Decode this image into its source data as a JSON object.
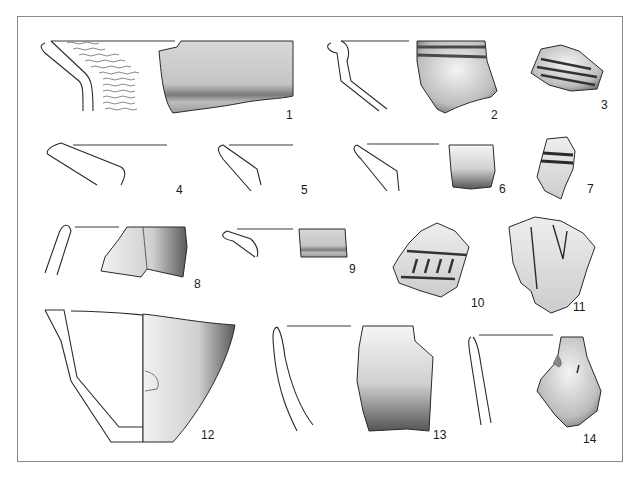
{
  "figure": {
    "type": "archaeological pottery sherd plate",
    "frame_color": "#8a8a8a",
    "ink_color": "#2a2a2a",
    "items": [
      {
        "label": "1",
        "desc": "rim profile with wavy incised decoration and sherd drawing"
      },
      {
        "label": "2",
        "desc": "rim profile and sherd with horizontal grooves"
      },
      {
        "label": "3",
        "desc": "body sherd with horizontal bands"
      },
      {
        "label": "4",
        "desc": "rim profile"
      },
      {
        "label": "5",
        "desc": "rim profile"
      },
      {
        "label": "6",
        "desc": "rim profile and sherd"
      },
      {
        "label": "7",
        "desc": "sherd with two dark bands"
      },
      {
        "label": "8",
        "desc": "rim profile and mended sherd"
      },
      {
        "label": "9",
        "desc": "rim profile and small sherd"
      },
      {
        "label": "10",
        "desc": "sherd with ribbed band decoration"
      },
      {
        "label": "11",
        "desc": "sherd with incised V lines"
      },
      {
        "label": "12",
        "desc": "half-section bowl profile and exterior view"
      },
      {
        "label": "13",
        "desc": "rim profile and sherd"
      },
      {
        "label": "14",
        "desc": "rim profile and sherd"
      }
    ]
  }
}
